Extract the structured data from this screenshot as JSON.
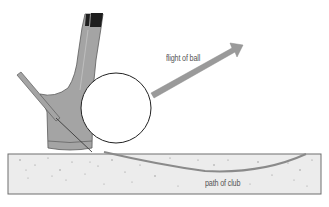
{
  "diagram": {
    "labels": {
      "flight": "flight of ball",
      "path": "path of club"
    },
    "colors": {
      "background": "#ffffff",
      "sand_fill": "#ececec",
      "sand_stroke": "#6e6e6e",
      "club_fill": "#a4a4a4",
      "club_dark": "#1e1e1e",
      "arrow_fill": "#9a9a9a",
      "path_stroke": "#8a8a8a",
      "ball_stroke": "#222222"
    },
    "elements": [
      "sand",
      "club-head",
      "club-shaft-line",
      "ball",
      "flight-arrow",
      "club-path-curve"
    ]
  }
}
